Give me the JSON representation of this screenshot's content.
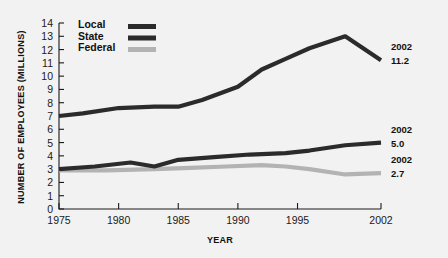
{
  "chart_data": {
    "type": "line",
    "title": "",
    "xlabel": "YEAR",
    "ylabel": "NUMBER OF EMPLOYEES (MILLIONS)",
    "xlim": [
      1975,
      2002
    ],
    "ylim": [
      0,
      14
    ],
    "grid": false,
    "legend_position": "top-center",
    "xticks": [
      1975,
      1980,
      1985,
      1990,
      1995,
      2002
    ],
    "xtick_labels": [
      "1975",
      "1980",
      "1985",
      "1990",
      "1995",
      "2002"
    ],
    "yticks": [
      0,
      1,
      2,
      3,
      4,
      5,
      6,
      7,
      8,
      9,
      10,
      11,
      12,
      13,
      14
    ],
    "ytick_labels": [
      "0",
      "1",
      "2",
      "3",
      "4",
      "5",
      "6",
      "7",
      "8",
      "9",
      "10",
      "11",
      "12",
      "13",
      "14"
    ],
    "series": [
      {
        "name": "Local",
        "color": "#2b2b2b",
        "x": [
          1975,
          1977,
          1980,
          1983,
          1985,
          1987,
          1990,
          1992,
          1994,
          1996,
          1999,
          2002
        ],
        "values": [
          7.0,
          7.2,
          7.6,
          7.7,
          7.7,
          8.2,
          9.2,
          10.5,
          11.3,
          12.1,
          13.0,
          11.2
        ],
        "end_label_year": "2002",
        "end_label_value": "11.2"
      },
      {
        "name": "State",
        "color": "#2b2b2b",
        "x": [
          1975,
          1978,
          1981,
          1983,
          1985,
          1988,
          1991,
          1994,
          1996,
          1999,
          2002
        ],
        "values": [
          3.0,
          3.2,
          3.5,
          3.2,
          3.7,
          3.9,
          4.1,
          4.2,
          4.4,
          4.8,
          5.0
        ],
        "end_label_year": "2002",
        "end_label_value": "5.0"
      },
      {
        "name": "Federal",
        "color": "#b3b3b3",
        "x": [
          1975,
          1979,
          1983,
          1986,
          1989,
          1992,
          1994,
          1996,
          1999,
          2002
        ],
        "values": [
          2.9,
          2.9,
          3.0,
          3.1,
          3.2,
          3.3,
          3.2,
          3.0,
          2.6,
          2.7
        ],
        "end_label_year": "2002",
        "end_label_value": "2.7"
      }
    ]
  },
  "legend": {
    "items": [
      {
        "label": "Local",
        "color": "#2b2b2b"
      },
      {
        "label": "State",
        "color": "#2b2b2b"
      },
      {
        "label": "Federal",
        "color": "#b3b3b3"
      }
    ]
  }
}
